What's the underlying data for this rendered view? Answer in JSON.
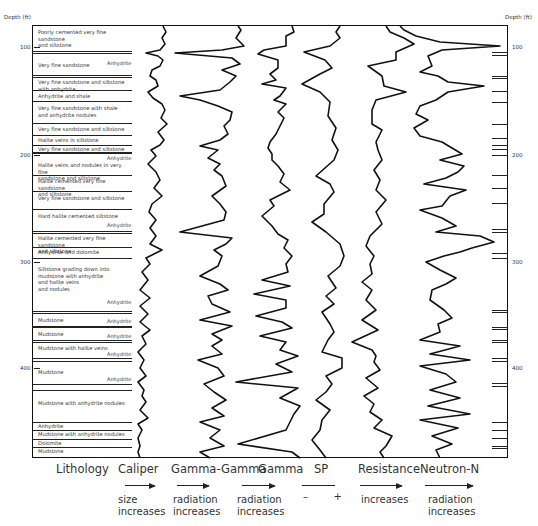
{
  "axis": {
    "left_header": "Depth (ft)",
    "right_header": "Depth (ft)",
    "depth_ticks": [
      {
        "label": "100",
        "y": 47
      },
      {
        "label": "200",
        "y": 155
      },
      {
        "label": "300",
        "y": 262
      },
      {
        "label": "400",
        "y": 368
      }
    ]
  },
  "lithology": {
    "layers": [
      {
        "text": "Poorly cemented very fine sandstone\n  and siltstone",
        "top": 27
      },
      {
        "text": "Very fine sandstone",
        "top": 61
      },
      {
        "text": "Very fine sandstone and siltstone\n  with anhydrite",
        "top": 79
      },
      {
        "text": "Anhydrite and shale",
        "top": 94
      },
      {
        "text": "Very fine sandstone with shale\n  and anhydrite nodules",
        "top": 106
      },
      {
        "text": "Very fine sandstone and siltstone",
        "top": 127
      },
      {
        "text": "Halite veins in siltstone",
        "top": 139
      },
      {
        "text": "Very fine sandstone and siltstone",
        "top": 148
      },
      {
        "text": "Halite veins and nodules in very fine\n  sandstone and siltstone",
        "top": 163
      },
      {
        "text": "Halite cemented very fine sandstone\n  and siltstone",
        "top": 179
      },
      {
        "text": "Very fine sandstone and siltstone",
        "top": 197
      },
      {
        "text": "Hard halite cemented siltstone",
        "top": 213
      },
      {
        "text": "Halite cemented very fine sandstone\n  and siltstone",
        "top": 237
      },
      {
        "text": "Anhydrite and dolomite",
        "top": 252
      },
      {
        "text": "Siltstone grading down into\n  mudstone with anhydrite\n  and halite veins\n  and nodules",
        "top": 268
      },
      {
        "text": "Mudstone",
        "top": 318
      },
      {
        "text": "Mudstone",
        "top": 333
      },
      {
        "text": "Mudstone with halite veins",
        "top": 347
      },
      {
        "text": "Mudstone",
        "top": 369
      },
      {
        "text": "Mudstone with anhydrite nodules",
        "top": 400
      },
      {
        "text": "Anhydrite",
        "top": 424
      },
      {
        "text": "Mudstone with anhydrite nodules",
        "top": 432
      },
      {
        "text": "Dolomite",
        "top": 441
      },
      {
        "text": "Mudstone",
        "top": 449
      }
    ],
    "boundaries": [
      51,
      52,
      75,
      76,
      90,
      101,
      123,
      135,
      145,
      152,
      153,
      175,
      191,
      209,
      231,
      232,
      247,
      258,
      311,
      313,
      326,
      327,
      340,
      342,
      360,
      384,
      390,
      421,
      429,
      438,
      446
    ],
    "anhydrite_labels": [
      {
        "text": "Anhydrite",
        "x": 95,
        "y": 62
      },
      {
        "text": "Anhydrite",
        "x": 98,
        "y": 157
      },
      {
        "text": "Anhydrite",
        "x": 100,
        "y": 224
      },
      {
        "text": "Anhydrite",
        "x": 103,
        "y": 301
      },
      {
        "text": "Anhydrite",
        "x": 103,
        "y": 319
      },
      {
        "text": "Anhydrite",
        "x": 103,
        "y": 335
      },
      {
        "text": "Anhydrite",
        "x": 103,
        "y": 353
      },
      {
        "text": "Anhydrite",
        "x": 102,
        "y": 373
      }
    ]
  },
  "tracks": [
    {
      "name": "Lithology",
      "x": 56
    },
    {
      "name": "Caliper",
      "x": 118
    },
    {
      "name": "Gamma-Gamma",
      "x": 171
    },
    {
      "name": "Gamma",
      "x": 258
    },
    {
      "name": "SP",
      "x": 314
    },
    {
      "name": "Resistance",
      "x": 358
    },
    {
      "name": "Neutron-N",
      "x": 420
    }
  ],
  "legend": [
    {
      "track": "Caliper",
      "text": "size\nincreases",
      "x": 118,
      "arrow_x": 125,
      "arrow_w": 30,
      "arrow": true
    },
    {
      "track": "Gamma-Gamma",
      "text": "radiation\nincreases",
      "x": 173,
      "arrow_x": 177,
      "arrow_w": 32,
      "arrow": true
    },
    {
      "track": "Gamma",
      "text": "radiation\nincreases",
      "x": 237,
      "arrow_x": 242,
      "arrow_w": 33,
      "arrow": true
    },
    {
      "track": "SP",
      "text": "–        +",
      "x": 303,
      "arrow_x": 302,
      "arrow_w": 33,
      "arrow": false
    },
    {
      "track": "Resistance",
      "text": "increases",
      "x": 361,
      "arrow_x": 360,
      "arrow_w": 42,
      "arrow": true
    },
    {
      "track": "Neutron-N",
      "text": "radiation\nincreases",
      "x": 428,
      "arrow_x": 425,
      "arrow_w": 48,
      "arrow": true
    }
  ],
  "right_ticks": [
    52,
    55,
    76,
    78,
    91,
    102,
    124,
    138,
    145,
    149,
    155,
    175,
    188,
    203,
    229,
    232,
    253,
    258,
    310,
    312,
    327,
    329,
    340,
    342,
    358,
    361,
    383,
    386,
    422,
    430,
    438,
    446,
    448
  ]
}
